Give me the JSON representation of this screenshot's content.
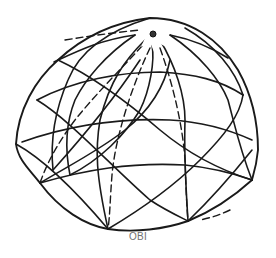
{
  "figure": {
    "caption": "OBI",
    "stroke_color": "#1a1a1a",
    "caption_color": "#707070",
    "apex_icon": "star-hub-icon"
  }
}
